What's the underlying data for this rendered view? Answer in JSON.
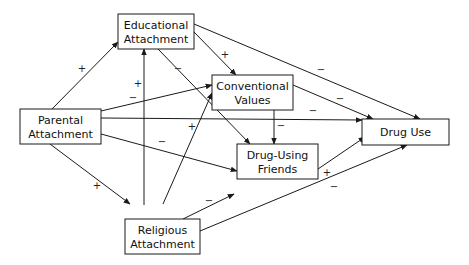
{
  "diagram": {
    "type": "path-model",
    "nodes": [
      {
        "id": "parental",
        "lines": [
          "Parental",
          "Attachment"
        ]
      },
      {
        "id": "educational",
        "lines": [
          "Educational",
          "Attachment"
        ]
      },
      {
        "id": "conventional",
        "lines": [
          "Conventional",
          "Values"
        ]
      },
      {
        "id": "friends",
        "lines": [
          "Drug-Using",
          "Friends"
        ]
      },
      {
        "id": "druguse",
        "lines": [
          "Drug Use"
        ]
      },
      {
        "id": "religious",
        "lines": [
          "Religious",
          "Attachment"
        ]
      }
    ],
    "edges": [
      {
        "from": "parental",
        "to": "educational",
        "sign": "+"
      },
      {
        "from": "parental",
        "to": "conventional",
        "sign": "−"
      },
      {
        "from": "parental",
        "to": "druguse",
        "sign": "−"
      },
      {
        "from": "parental",
        "to": "friends",
        "sign": "−"
      },
      {
        "from": "parental",
        "to": "religious",
        "sign": "+"
      },
      {
        "from": "educational",
        "to": "conventional",
        "sign": "+"
      },
      {
        "from": "educational",
        "to": "friends",
        "sign": "−"
      },
      {
        "from": "educational",
        "to": "druguse",
        "sign": "−"
      },
      {
        "from": "religious",
        "to": "educational",
        "sign": "+"
      },
      {
        "from": "religious",
        "to": "conventional",
        "sign": "+"
      },
      {
        "from": "religious",
        "to": "friends",
        "sign": "−"
      },
      {
        "from": "religious",
        "to": "druguse",
        "sign": "−"
      },
      {
        "from": "conventional",
        "to": "druguse",
        "sign": "−"
      },
      {
        "from": "conventional",
        "to": "friends",
        "sign": "−"
      },
      {
        "from": "friends",
        "to": "druguse",
        "sign": "+"
      }
    ],
    "colors": {
      "stroke": "#1a1a1a",
      "text": "#111111",
      "background": "#ffffff"
    }
  }
}
